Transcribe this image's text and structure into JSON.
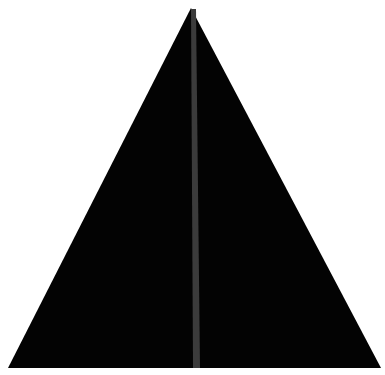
{
  "canvas": {
    "width": 385,
    "height": 375,
    "background": "#ffffff"
  },
  "shape": {
    "type": "triangle",
    "fill": "#030303",
    "points": "191,8 8,368 381,368"
  },
  "stripe": {
    "fill": "#3b3b3b",
    "points": "191,9 196,9 200,368 193,368"
  }
}
